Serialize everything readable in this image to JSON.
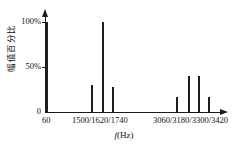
{
  "chart_data": {
    "type": "bar",
    "title": "",
    "subtitle": "",
    "xlabel": "f(Hz)",
    "ylabel": "幅值百分比",
    "ylim": [
      0,
      100
    ],
    "yticks": [
      0,
      50,
      100
    ],
    "ytick_labels": [
      "0",
      "50%",
      "100%"
    ],
    "grid": false,
    "legend": null,
    "categories": [
      "60",
      "1500",
      "1620",
      "1740",
      "3060",
      "3180",
      "3300",
      "3420"
    ],
    "values": [
      100,
      30,
      100,
      28,
      17,
      40,
      40,
      17
    ],
    "series": [
      {
        "name": "幅值百分比",
        "values": [
          100,
          30,
          100,
          28,
          17,
          40,
          40,
          17
        ]
      }
    ],
    "x_tick_groups": [
      {
        "label": "60",
        "center_px": 47
      },
      {
        "label": "1500/1620/1740",
        "center_px": 103
      },
      {
        "label": "3060/3180/3300/3420",
        "center_px": 193
      }
    ],
    "bar_color": "#1f1f1f",
    "axis_color": "#1a1a1a",
    "background": "#ffffff"
  },
  "axis": {
    "y_label": "幅值百分比",
    "y_tick_0": "0",
    "y_tick_50": "50%",
    "y_tick_100": "100%",
    "x_label_f": "f",
    "x_label_unit": "(Hz)",
    "x_group_1": "60",
    "x_group_2": "1500/1620/1740",
    "x_group_3": "3060/3180/3300/3420"
  },
  "bars": [
    {
      "name": "bar-60hz",
      "freq": "60",
      "value": 100
    },
    {
      "name": "bar-1500hz",
      "freq": "1500",
      "value": 30
    },
    {
      "name": "bar-1620hz",
      "freq": "1620",
      "value": 100
    },
    {
      "name": "bar-1740hz",
      "freq": "1740",
      "value": 28
    },
    {
      "name": "bar-3060hz",
      "freq": "3060",
      "value": 17
    },
    {
      "name": "bar-3180hz",
      "freq": "3180",
      "value": 40
    },
    {
      "name": "bar-3300hz",
      "freq": "3300",
      "value": 40
    },
    {
      "name": "bar-3420hz",
      "freq": "3420",
      "value": 17
    }
  ]
}
